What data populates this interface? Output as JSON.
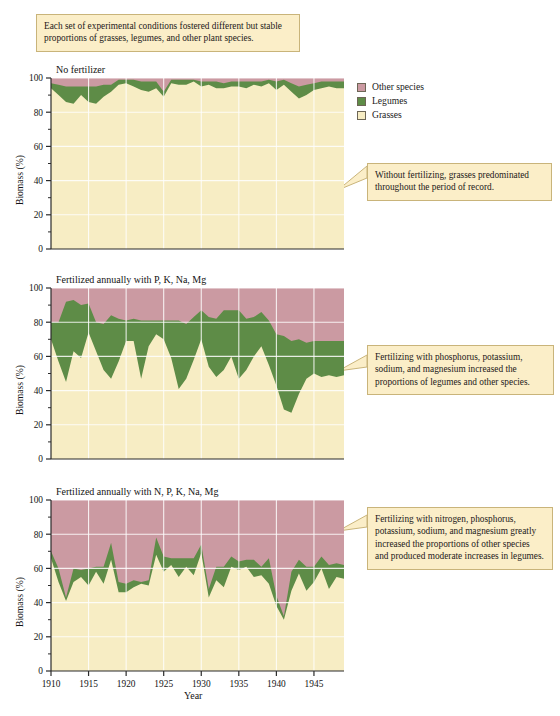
{
  "figure": {
    "top_note": "Each set of experimental conditions fostered different but stable proportions of grasses, legumes, and other plant species.",
    "x_axis_title": "Year",
    "y_axis_title": "Biomass (%)"
  },
  "legend": {
    "items": [
      {
        "label": "Other species",
        "color": "#cb9aa2"
      },
      {
        "label": "Legumes",
        "color": "#5e8c47"
      },
      {
        "label": "Grasses",
        "color": "#f7edc4"
      }
    ]
  },
  "callouts": [
    {
      "name": "callout-no-fertilizer",
      "text": "Without fertilizing, grasses predominated throughout the period of record."
    },
    {
      "name": "callout-pknamg",
      "text": "Fertilizing with phosphorus, potassium, sodium, and magnesium increased the proportions of legumes and other species."
    },
    {
      "name": "callout-npknamg",
      "text": "Fertilizing with nitrogen, phosphorus, potassium, sodium, and magnesium greatly increased the proportions of other species and produced moderate increases in legumes."
    }
  ],
  "axes": {
    "y_ticks": [
      0,
      20,
      40,
      60,
      80,
      100
    ],
    "y_minor_ticks": [
      10,
      30,
      50,
      70,
      90
    ],
    "ylim": [
      0,
      100
    ],
    "x_ticks": [
      1910,
      1915,
      1920,
      1925,
      1930,
      1935,
      1940,
      1945
    ],
    "xlim": [
      1910,
      1949
    ],
    "grid": true,
    "grid_color": "#ffffff"
  },
  "chart_data": [
    {
      "type": "area",
      "name": "panel-no-fertilizer",
      "title": "No fertilizer",
      "stacked": true,
      "xlabel": "Year",
      "ylabel": "Biomass (%)",
      "ylim": [
        0,
        100
      ],
      "xlim": [
        1910,
        1949
      ],
      "x": [
        1910,
        1911,
        1912,
        1913,
        1914,
        1915,
        1916,
        1917,
        1918,
        1919,
        1920,
        1921,
        1922,
        1923,
        1924,
        1925,
        1926,
        1927,
        1928,
        1929,
        1930,
        1931,
        1932,
        1933,
        1934,
        1935,
        1936,
        1937,
        1938,
        1939,
        1940,
        1941,
        1942,
        1943,
        1944,
        1945,
        1946,
        1947,
        1948,
        1949
      ],
      "series": [
        {
          "name": "Grasses",
          "color": "#f7edc4",
          "values": [
            94,
            90,
            86,
            85,
            90,
            86,
            85,
            89,
            92,
            96,
            97,
            95,
            93,
            92,
            94,
            89,
            97,
            96,
            96,
            98,
            95,
            96,
            94,
            94,
            95,
            95,
            94,
            96,
            95,
            97,
            93,
            96,
            92,
            88,
            90,
            93,
            94,
            95,
            94,
            94
          ]
        },
        {
          "name": "Legumes",
          "color": "#5e8c47",
          "values": [
            3,
            6,
            9,
            10,
            5,
            9,
            10,
            7,
            4,
            3,
            2,
            4,
            5,
            6,
            4,
            3,
            2,
            3,
            3,
            1,
            3,
            2,
            4,
            3,
            3,
            3,
            4,
            2,
            3,
            2,
            5,
            3,
            5,
            7,
            6,
            4,
            4,
            3,
            4,
            4
          ]
        },
        {
          "name": "Other species",
          "color": "#cb9aa2",
          "values": [
            3,
            4,
            5,
            5,
            5,
            5,
            5,
            4,
            4,
            1,
            1,
            1,
            2,
            2,
            2,
            8,
            1,
            1,
            1,
            1,
            2,
            2,
            2,
            3,
            2,
            2,
            2,
            2,
            2,
            1,
            2,
            1,
            3,
            5,
            4,
            3,
            2,
            2,
            2,
            2
          ]
        }
      ]
    },
    {
      "type": "area",
      "name": "panel-p-k-na-mg",
      "title": "Fertilized annually with P, K, Na, Mg",
      "stacked": true,
      "xlabel": "Year",
      "ylabel": "Biomass (%)",
      "ylim": [
        0,
        100
      ],
      "xlim": [
        1910,
        1949
      ],
      "x": [
        1910,
        1911,
        1912,
        1913,
        1914,
        1915,
        1916,
        1917,
        1918,
        1919,
        1920,
        1921,
        1922,
        1923,
        1924,
        1925,
        1926,
        1927,
        1928,
        1929,
        1930,
        1931,
        1932,
        1933,
        1934,
        1935,
        1936,
        1937,
        1938,
        1939,
        1940,
        1941,
        1942,
        1943,
        1944,
        1945,
        1946,
        1947,
        1948,
        1949
      ],
      "series": [
        {
          "name": "Grasses",
          "color": "#f7edc4",
          "values": [
            70,
            57,
            45,
            63,
            59,
            74,
            63,
            52,
            47,
            57,
            69,
            69,
            47,
            66,
            73,
            70,
            59,
            41,
            47,
            58,
            70,
            54,
            48,
            52,
            60,
            47,
            52,
            60,
            66,
            55,
            43,
            29,
            27,
            38,
            47,
            50,
            48,
            49,
            48,
            49
          ]
        },
        {
          "name": "Legumes",
          "color": "#5e8c47",
          "values": [
            10,
            23,
            47,
            30,
            31,
            17,
            17,
            27,
            37,
            25,
            12,
            13,
            34,
            15,
            8,
            11,
            22,
            40,
            32,
            25,
            17,
            29,
            34,
            35,
            27,
            40,
            30,
            23,
            20,
            26,
            30,
            43,
            42,
            32,
            21,
            19,
            21,
            20,
            21,
            20
          ]
        },
        {
          "name": "Other species",
          "color": "#cb9aa2",
          "values": [
            20,
            20,
            8,
            7,
            10,
            9,
            20,
            21,
            16,
            18,
            19,
            18,
            19,
            19,
            19,
            19,
            19,
            19,
            21,
            17,
            13,
            17,
            18,
            13,
            13,
            13,
            18,
            17,
            14,
            19,
            27,
            28,
            31,
            30,
            32,
            31,
            31,
            31,
            31,
            31
          ]
        }
      ]
    },
    {
      "type": "area",
      "name": "panel-n-p-k-na-mg",
      "title": "Fertilized annually with N, P, K, Na, Mg",
      "stacked": true,
      "xlabel": "Year",
      "ylabel": "Biomass (%)",
      "ylim": [
        0,
        100
      ],
      "xlim": [
        1910,
        1949
      ],
      "x": [
        1910,
        1911,
        1912,
        1913,
        1914,
        1915,
        1916,
        1917,
        1918,
        1919,
        1920,
        1921,
        1922,
        1923,
        1924,
        1925,
        1926,
        1927,
        1928,
        1929,
        1930,
        1931,
        1932,
        1933,
        1934,
        1935,
        1936,
        1937,
        1938,
        1939,
        1940,
        1941,
        1942,
        1943,
        1944,
        1945,
        1946,
        1947,
        1948,
        1949
      ],
      "series": [
        {
          "name": "Grasses",
          "color": "#f7edc4",
          "values": [
            66,
            52,
            41,
            52,
            55,
            50,
            58,
            51,
            65,
            46,
            46,
            49,
            51,
            50,
            68,
            58,
            62,
            55,
            61,
            56,
            69,
            43,
            53,
            49,
            61,
            59,
            61,
            55,
            56,
            51,
            38,
            30,
            47,
            57,
            47,
            52,
            60,
            48,
            55,
            54
          ]
        },
        {
          "name": "Legumes",
          "color": "#5e8c47",
          "values": [
            4,
            8,
            2,
            8,
            4,
            10,
            3,
            10,
            10,
            6,
            5,
            4,
            1,
            3,
            10,
            9,
            4,
            11,
            5,
            10,
            5,
            5,
            8,
            12,
            6,
            5,
            4,
            10,
            5,
            15,
            6,
            2,
            11,
            8,
            14,
            9,
            7,
            14,
            8,
            8
          ]
        },
        {
          "name": "Other species",
          "color": "#cb9aa2",
          "values": [
            30,
            40,
            57,
            40,
            41,
            40,
            39,
            39,
            25,
            48,
            49,
            47,
            48,
            47,
            22,
            33,
            34,
            34,
            34,
            34,
            26,
            52,
            39,
            39,
            33,
            36,
            35,
            35,
            39,
            34,
            56,
            68,
            42,
            35,
            39,
            39,
            33,
            38,
            37,
            38
          ]
        }
      ]
    }
  ]
}
